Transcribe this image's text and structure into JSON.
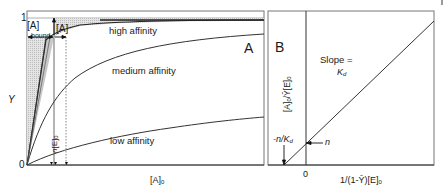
{
  "panel_a": {
    "letter": "A",
    "y_axis": {
      "label": "Y",
      "tick_top": "1",
      "tick_bottom": "0"
    },
    "x_axis": {
      "label": "[A]",
      "label_sub": "0"
    },
    "curves": [
      {
        "name": "high affinity",
        "label": "high affinity"
      },
      {
        "name": "medium affinity",
        "label": "medium affinity"
      },
      {
        "name": "low affinity",
        "label": "low affinity"
      }
    ],
    "annotations": {
      "bound": {
        "main": "[A]",
        "sub": "bound"
      },
      "free": {
        "main": "[A]"
      },
      "n_e0": {
        "main": "n[E]",
        "sub": "0"
      }
    }
  },
  "panel_b": {
    "letter": "B",
    "y_axis": {
      "label": "[A]",
      "label_sub": "0",
      "label_rest": "/Ȳ[E]",
      "label_rest_sub": "0"
    },
    "x_axis": {
      "label": "1/(1-Ȳ)[E]",
      "label_sub": "0",
      "tick_zero": "0"
    },
    "slope_text": "Slope =",
    "slope_value": "K",
    "slope_value_sub": "d",
    "x_intercept": {
      "main": "-n/K",
      "sub": "d"
    },
    "y_intercept": "n"
  },
  "colors": {
    "frame": "#555555",
    "curve": "#333333",
    "shade": "#cfcfcf",
    "text": "#1a1a1a"
  }
}
